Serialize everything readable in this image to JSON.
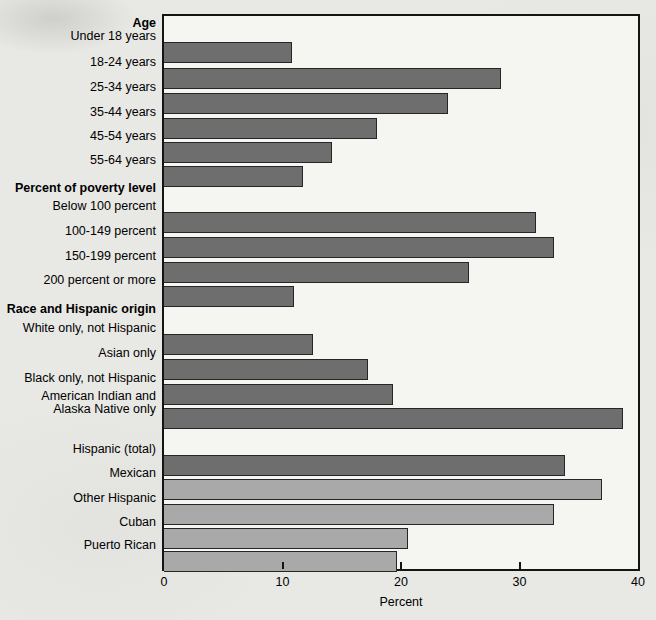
{
  "page": {
    "background_color": "#e8e8e5",
    "plot_background_color": "#f5f5f2",
    "frame_color": "#141414"
  },
  "chart_data": {
    "type": "bar",
    "orientation": "horizontal",
    "title": "",
    "xlabel": "Percent",
    "ylabel": "",
    "xlim": [
      0,
      40
    ],
    "xticks": [
      0,
      10,
      20,
      30,
      40
    ],
    "grid": false,
    "legend": "none",
    "colors": {
      "dark": "#6e6e6e",
      "light": "#a9a9a9",
      "bar_border": "#262626"
    },
    "groups": [
      {
        "header": "Age",
        "items": [
          {
            "label": "Under 18 years",
            "value": 10.8,
            "shade": "dark"
          },
          {
            "label": "18-24 years",
            "value": 28.4,
            "shade": "dark"
          },
          {
            "label": "25-34 years",
            "value": 24.0,
            "shade": "dark"
          },
          {
            "label": "35-44 years",
            "value": 18.0,
            "shade": "dark"
          },
          {
            "label": "45-54 years",
            "value": 14.2,
            "shade": "dark"
          },
          {
            "label": "55-64 years",
            "value": 11.7,
            "shade": "dark"
          }
        ]
      },
      {
        "header": "Percent of poverty level",
        "items": [
          {
            "label": "Below 100 percent",
            "value": 31.4,
            "shade": "dark"
          },
          {
            "label": "100-149 percent",
            "value": 32.9,
            "shade": "dark"
          },
          {
            "label": "150-199 percent",
            "value": 25.7,
            "shade": "dark"
          },
          {
            "label": "200 percent or more",
            "value": 11.0,
            "shade": "dark"
          }
        ]
      },
      {
        "header": "Race and Hispanic origin",
        "items": [
          {
            "label": "White only, not Hispanic",
            "value": 12.6,
            "shade": "dark"
          },
          {
            "label": "Asian only",
            "value": 17.2,
            "shade": "dark"
          },
          {
            "label": "Black only, not Hispanic",
            "value": 19.3,
            "shade": "dark"
          },
          {
            "label": "American Indian and\nAlaska Native only",
            "value": 38.7,
            "shade": "dark"
          }
        ]
      },
      {
        "header": null,
        "items": [
          {
            "label": "Hispanic (total)",
            "value": 33.8,
            "shade": "dark"
          },
          {
            "label": "Mexican",
            "value": 37.0,
            "shade": "light"
          },
          {
            "label": "Other Hispanic",
            "value": 32.9,
            "shade": "light"
          },
          {
            "label": "Cuban",
            "value": 20.6,
            "shade": "light"
          },
          {
            "label": "Puerto Rican",
            "value": 19.7,
            "shade": "light"
          }
        ]
      }
    ]
  }
}
